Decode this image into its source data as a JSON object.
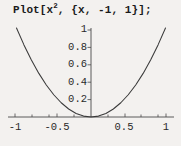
{
  "notebook": {
    "input_cell": {
      "code_prefix": "Plot[x",
      "code_exponent": "2",
      "code_suffix": ", {x, -1, 1}];",
      "full_text": "Plot[x^2, {x, -1, 1}];"
    }
  },
  "chart_data": {
    "type": "line",
    "title": "",
    "xlabel": "",
    "ylabel": "",
    "function": "x^2",
    "xlim": [
      -1,
      1
    ],
    "ylim": [
      0,
      1
    ],
    "grid": false,
    "legend": false,
    "x_ticks": [
      {
        "value": -1,
        "label": "-1"
      },
      {
        "value": -0.5,
        "label": "-0.5"
      },
      {
        "value": 0.5,
        "label": "0.5"
      },
      {
        "value": 1,
        "label": "1"
      }
    ],
    "y_ticks": [
      {
        "value": 1,
        "label": "1"
      },
      {
        "value": 0.8,
        "label": "0.8"
      },
      {
        "value": 0.6,
        "label": "0.6"
      },
      {
        "value": 0.4,
        "label": "0.4"
      },
      {
        "value": 0.2,
        "label": "0.2"
      }
    ],
    "x": [
      -1,
      -0.9,
      -0.8,
      -0.7,
      -0.6,
      -0.5,
      -0.4,
      -0.3,
      -0.2,
      -0.1,
      0,
      0.1,
      0.2,
      0.3,
      0.4,
      0.5,
      0.6,
      0.7,
      0.8,
      0.9,
      1
    ],
    "values": [
      1,
      0.81,
      0.64,
      0.49,
      0.36,
      0.25,
      0.16,
      0.09,
      0.04,
      0.01,
      0,
      0.01,
      0.04,
      0.09,
      0.16,
      0.25,
      0.36,
      0.49,
      0.64,
      0.81,
      1
    ],
    "colors": {
      "background": "#f3f1ef",
      "curve": "#3a3a3a",
      "axis": "#4a4a4a",
      "text": "#2a2a2a"
    }
  }
}
